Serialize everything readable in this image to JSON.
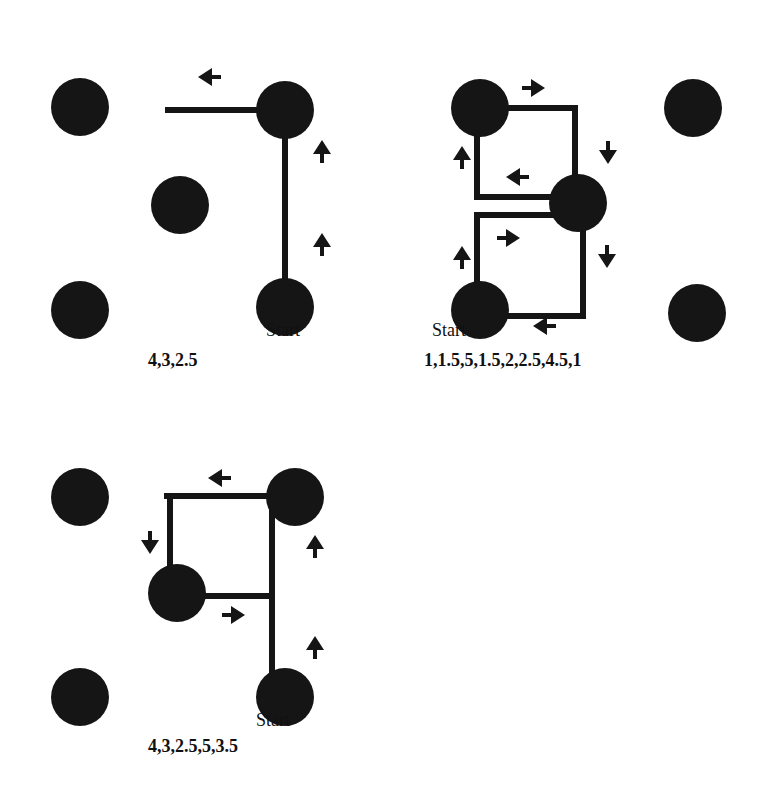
{
  "colors": {
    "ink": "#151515",
    "background": "#ffffff"
  },
  "diagrams": [
    {
      "id": "path-1",
      "start_label": "Start",
      "sequence": "4,3,2.5",
      "circles": [
        [
          80,
          107
        ],
        [
          180,
          205
        ],
        [
          80,
          310
        ],
        [
          285,
          110
        ],
        [
          285,
          307
        ]
      ],
      "segments": [
        [
          168,
          110,
          285,
          110
        ],
        [
          285,
          110,
          285,
          307
        ]
      ],
      "arrows": [
        {
          "x": 210,
          "y": 77,
          "dir": "left"
        },
        {
          "x": 322,
          "y": 152,
          "dir": "up"
        },
        {
          "x": 322,
          "y": 245,
          "dir": "up"
        }
      ],
      "start_pos": [
        266,
        338
      ],
      "sequence_pos": [
        148,
        368
      ]
    },
    {
      "id": "path-2",
      "start_label": "Start",
      "sequence": "1,1.5,5,1.5,2,2.5,4.5,1",
      "circles": [
        [
          480,
          108
        ],
        [
          578,
          203
        ],
        [
          480,
          310
        ],
        [
          693,
          108
        ],
        [
          697,
          313
        ]
      ],
      "segments": [
        [
          480,
          108,
          575,
          108
        ],
        [
          575,
          108,
          575,
          200
        ],
        [
          555,
          197,
          477,
          197
        ],
        [
          477,
          197,
          477,
          108
        ],
        [
          555,
          215,
          477,
          215
        ],
        [
          477,
          215,
          477,
          310
        ],
        [
          480,
          316,
          583,
          316
        ],
        [
          583,
          316,
          583,
          205
        ]
      ],
      "arrows": [
        {
          "x": 533,
          "y": 88,
          "dir": "right"
        },
        {
          "x": 608,
          "y": 152,
          "dir": "down"
        },
        {
          "x": 518,
          "y": 177,
          "dir": "left"
        },
        {
          "x": 462,
          "y": 158,
          "dir": "up"
        },
        {
          "x": 508,
          "y": 238,
          "dir": "right"
        },
        {
          "x": 607,
          "y": 256,
          "dir": "down"
        },
        {
          "x": 462,
          "y": 258,
          "dir": "up"
        },
        {
          "x": 545,
          "y": 326,
          "dir": "left"
        }
      ],
      "start_pos": [
        432,
        338
      ],
      "sequence_pos": [
        424,
        368
      ]
    },
    {
      "id": "path-3",
      "start_label": "Start",
      "sequence": "4,3,2.5,5,3.5",
      "circles": [
        [
          80,
          497
        ],
        [
          177,
          593
        ],
        [
          80,
          697
        ],
        [
          295,
          497
        ],
        [
          285,
          697
        ]
      ],
      "segments": [
        [
          167,
          496,
          295,
          496
        ],
        [
          170,
          496,
          170,
          580
        ],
        [
          177,
          596,
          272,
          596
        ],
        [
          272,
          496,
          272,
          690
        ]
      ],
      "arrows": [
        {
          "x": 220,
          "y": 478,
          "dir": "left"
        },
        {
          "x": 150,
          "y": 542,
          "dir": "down"
        },
        {
          "x": 315,
          "y": 547,
          "dir": "up"
        },
        {
          "x": 233,
          "y": 615,
          "dir": "right"
        },
        {
          "x": 315,
          "y": 648,
          "dir": "up"
        }
      ],
      "start_pos": [
        256,
        728
      ],
      "sequence_pos": [
        148,
        754
      ]
    }
  ]
}
